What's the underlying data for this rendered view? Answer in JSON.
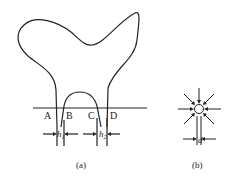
{
  "figure_a": {
    "points": [
      "A",
      "B",
      "C",
      "D"
    ],
    "h1": "h",
    "h1_sub": "1",
    "h2": "h",
    "h2_sub": "2",
    "caption": "(a)"
  },
  "figure_b": {
    "d_label": "d",
    "caption": "(b)"
  },
  "colors": {
    "stroke": "#222222",
    "background": "#ffffff"
  }
}
